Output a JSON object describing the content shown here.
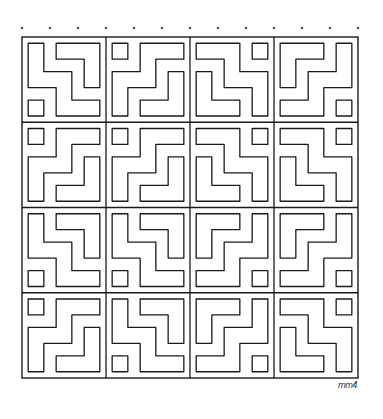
{
  "artwork": {
    "description": "Hand-drawn maze-like tessellation of 4x4 blocks, each 3x3 cells with a small corner square and interlocking stepped shapes",
    "grid": {
      "blocks_x": 4,
      "blocks_y": 4,
      "cells_per_block": 3,
      "left": 22,
      "top": 37,
      "right": 358,
      "bottom": 378
    },
    "top_dots": 13,
    "stroke_color": "#1a1a1a",
    "background": "#ffffff",
    "blocks": [
      [
        "bottom-left",
        "top-left",
        "top-right",
        "bottom-right"
      ],
      [
        "top-left",
        "top-left",
        "top-right",
        "top-right"
      ],
      [
        "bottom-left",
        "bottom-left",
        "bottom-right",
        "bottom-right"
      ],
      [
        "top-left",
        "bottom-left",
        "bottom-right",
        "top-right"
      ]
    ]
  },
  "signature": {
    "text": "mm4"
  }
}
